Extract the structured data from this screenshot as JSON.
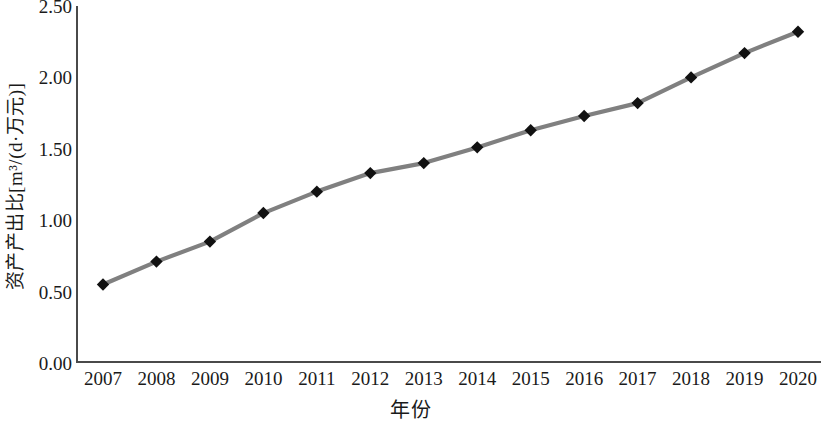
{
  "chart_data": {
    "type": "line",
    "title": "",
    "xlabel": "年份",
    "ylabel": "资产产出比[m³/(d·万元)]",
    "x": [
      2007,
      2008,
      2009,
      2010,
      2011,
      2012,
      2013,
      2014,
      2015,
      2016,
      2017,
      2018,
      2019,
      2020
    ],
    "categories": [
      "2007",
      "2008",
      "2009",
      "2010",
      "2011",
      "2012",
      "2013",
      "2014",
      "2015",
      "2016",
      "2017",
      "2018",
      "2019",
      "2020"
    ],
    "values": [
      0.55,
      0.71,
      0.85,
      1.05,
      1.2,
      1.33,
      1.4,
      1.51,
      1.63,
      1.73,
      1.82,
      2.0,
      2.17,
      2.32
    ],
    "series": [
      {
        "name": "资产产出比",
        "values": [
          0.55,
          0.71,
          0.85,
          1.05,
          1.2,
          1.33,
          1.4,
          1.51,
          1.63,
          1.73,
          1.82,
          2.0,
          2.17,
          2.32
        ]
      }
    ],
    "ylim": [
      0.0,
      2.5
    ],
    "yticks": [
      0.0,
      0.5,
      1.0,
      1.5,
      2.0,
      2.5
    ],
    "ytick_labels": [
      "0.00",
      "0.50",
      "1.00",
      "1.50",
      "2.00",
      "2.50"
    ],
    "grid": false,
    "legend": false,
    "legend_position": "none",
    "line_color": "#808080",
    "marker_color": "#111111",
    "marker": "diamond",
    "axis_color": "#4a4a4a",
    "background_color": "#ffffff"
  }
}
